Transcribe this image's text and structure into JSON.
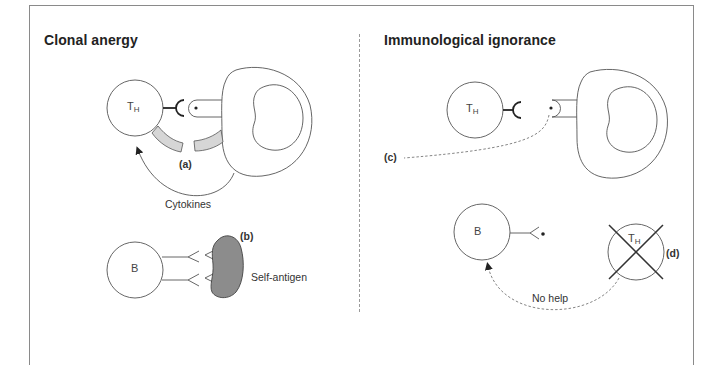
{
  "figure": {
    "panels": [
      {
        "id": "clonal-anergy",
        "title": "Clonal anergy",
        "cells": {
          "t_helper": {
            "label": "T",
            "subscript": "H"
          },
          "b_cell": {
            "label": "B"
          }
        },
        "labels": {
          "a": "(a)",
          "b": "(b)",
          "cytokines": "Cytokines",
          "self_antigen": "Self-antigen"
        }
      },
      {
        "id": "immunological-ignorance",
        "title": "Immunological ignorance",
        "cells": {
          "t_helper": {
            "label": "T",
            "subscript": "H"
          },
          "b_cell": {
            "label": "B"
          },
          "t_helper_absent": {
            "label": "T",
            "subscript": "H"
          }
        },
        "labels": {
          "c": "(c)",
          "d": "(d)",
          "no_help": "No help"
        }
      }
    ],
    "colors": {
      "line": "#555555",
      "receptor": "#222222",
      "costim_fill": "#d6d6d6",
      "antigen_fill": "#8c8c8c",
      "frame": "#8a8a8a"
    }
  }
}
